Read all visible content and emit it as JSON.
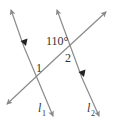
{
  "diagram": {
    "type": "parallel-lines-transversal",
    "line_color": "#8a8a8a",
    "marker_color": "#222222",
    "lines": [
      {
        "id": "l1",
        "label_main": "l",
        "label_sub": "1"
      },
      {
        "id": "l2",
        "label_main": "l",
        "label_sub": "2"
      },
      {
        "id": "transversal"
      }
    ],
    "angles": {
      "given": "110°",
      "angle1": "1",
      "angle2": "2"
    }
  }
}
